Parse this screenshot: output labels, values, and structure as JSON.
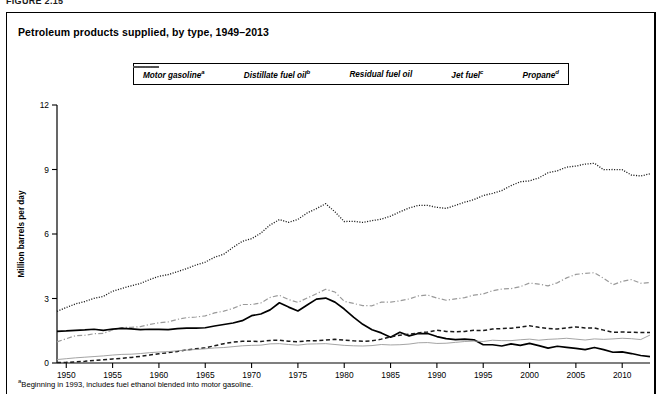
{
  "figure_label": "FIGURE 2.15",
  "chart_title": "Petroleum products supplied, by type, 1949–2013",
  "footnote": "Beginning in 1993, includes fuel ethanol blended into motor gasoline.",
  "footnote_marker": "a",
  "legend": {
    "items": [
      {
        "label": "Motor gasoline",
        "marker": "a",
        "style": "dotted",
        "color": "#1a1a1a",
        "name": "legend-item-motor-gasoline"
      },
      {
        "label": "Distillate fuel oil",
        "marker": "b",
        "style": "dash-dot-light",
        "color": "#9a9a9a",
        "name": "legend-item-distillate-fuel-oil"
      },
      {
        "label": "Residual fuel oil",
        "marker": "",
        "style": "solid",
        "color": "#000000",
        "name": "legend-item-residual-fuel-oil"
      },
      {
        "label": "Jet fuel",
        "marker": "c",
        "style": "dashed",
        "color": "#1a1a1a",
        "name": "legend-item-jet-fuel"
      },
      {
        "label": "Propane",
        "marker": "d",
        "style": "thin-solid-light",
        "color": "#9a9a9a",
        "name": "legend-item-propane"
      }
    ]
  },
  "chart_data": {
    "type": "line",
    "title": "Petroleum products supplied, by type, 1949–2013",
    "xlabel": "",
    "ylabel": "Million barrels per day",
    "xlim": [
      1949,
      2013
    ],
    "ylim": [
      0,
      12
    ],
    "yticks": [
      0,
      3,
      6,
      9,
      12
    ],
    "xticks": [
      1950,
      1955,
      1960,
      1965,
      1970,
      1975,
      1980,
      1985,
      1990,
      1995,
      2000,
      2005,
      2010
    ],
    "grid": false,
    "legend_position": "top-center",
    "x": [
      1949,
      1950,
      1951,
      1952,
      1953,
      1954,
      1955,
      1956,
      1957,
      1958,
      1959,
      1960,
      1961,
      1962,
      1963,
      1964,
      1965,
      1966,
      1967,
      1968,
      1969,
      1970,
      1971,
      1972,
      1973,
      1974,
      1975,
      1976,
      1977,
      1978,
      1979,
      1980,
      1981,
      1982,
      1983,
      1984,
      1985,
      1986,
      1987,
      1988,
      1989,
      1990,
      1991,
      1992,
      1993,
      1994,
      1995,
      1996,
      1997,
      1998,
      1999,
      2000,
      2001,
      2002,
      2003,
      2004,
      2005,
      2006,
      2007,
      2008,
      2009,
      2010,
      2011,
      2012,
      2013
    ],
    "series": [
      {
        "name": "Motor gasoline",
        "marker": "a",
        "style": "dotted",
        "color": "#1a1a1a",
        "values": [
          2.4,
          2.58,
          2.75,
          2.86,
          3.01,
          3.1,
          3.34,
          3.47,
          3.59,
          3.7,
          3.88,
          4.03,
          4.11,
          4.25,
          4.39,
          4.56,
          4.69,
          4.92,
          5.06,
          5.38,
          5.66,
          5.78,
          6.04,
          6.42,
          6.67,
          6.54,
          6.68,
          6.98,
          7.18,
          7.41,
          7.03,
          6.58,
          6.59,
          6.54,
          6.62,
          6.69,
          6.83,
          7.03,
          7.21,
          7.33,
          7.33,
          7.24,
          7.19,
          7.33,
          7.48,
          7.6,
          7.79,
          7.89,
          8.02,
          8.25,
          8.43,
          8.47,
          8.61,
          8.85,
          8.94,
          9.11,
          9.16,
          9.25,
          9.29,
          8.99,
          9.0,
          8.99,
          8.74,
          8.7,
          8.8
        ]
      },
      {
        "name": "Distillate fuel oil",
        "marker": "b",
        "style": "dash-dot-light",
        "color": "#9a9a9a",
        "values": [
          0.98,
          1.13,
          1.27,
          1.29,
          1.36,
          1.38,
          1.54,
          1.65,
          1.66,
          1.69,
          1.79,
          1.87,
          1.91,
          2.03,
          2.11,
          2.14,
          2.19,
          2.33,
          2.41,
          2.54,
          2.72,
          2.72,
          2.79,
          3.05,
          3.15,
          2.95,
          2.82,
          3.02,
          3.22,
          3.43,
          3.3,
          2.87,
          2.77,
          2.67,
          2.66,
          2.83,
          2.83,
          2.89,
          2.98,
          3.12,
          3.16,
          3.02,
          2.92,
          2.98,
          3.04,
          3.16,
          3.21,
          3.36,
          3.44,
          3.46,
          3.55,
          3.72,
          3.67,
          3.59,
          3.73,
          3.96,
          4.12,
          4.17,
          4.2,
          3.94,
          3.64,
          3.8,
          3.88,
          3.71,
          3.74
        ]
      },
      {
        "name": "Residual fuel oil",
        "marker": "",
        "style": "solid",
        "color": "#000000",
        "values": [
          1.47,
          1.49,
          1.52,
          1.54,
          1.57,
          1.52,
          1.58,
          1.61,
          1.59,
          1.55,
          1.57,
          1.56,
          1.55,
          1.6,
          1.62,
          1.62,
          1.64,
          1.72,
          1.79,
          1.86,
          1.97,
          2.2,
          2.28,
          2.47,
          2.8,
          2.6,
          2.42,
          2.7,
          2.97,
          3.02,
          2.83,
          2.51,
          2.13,
          1.8,
          1.55,
          1.4,
          1.2,
          1.43,
          1.26,
          1.37,
          1.37,
          1.23,
          1.13,
          1.09,
          1.11,
          1.08,
          0.85,
          0.85,
          0.79,
          0.89,
          0.82,
          0.91,
          0.81,
          0.69,
          0.78,
          0.73,
          0.68,
          0.62,
          0.72,
          0.62,
          0.5,
          0.52,
          0.44,
          0.35,
          0.3
        ]
      },
      {
        "name": "Jet fuel",
        "marker": "c",
        "style": "dashed",
        "color": "#1a1a1a",
        "values": [
          0.02,
          0.03,
          0.05,
          0.08,
          0.12,
          0.15,
          0.19,
          0.22,
          0.26,
          0.31,
          0.37,
          0.43,
          0.48,
          0.54,
          0.61,
          0.66,
          0.71,
          0.8,
          0.9,
          0.97,
          1.01,
          1.01,
          1.0,
          1.05,
          1.06,
          1.01,
          0.99,
          1.03,
          1.04,
          1.07,
          1.1,
          1.07,
          1.03,
          1.01,
          1.03,
          1.11,
          1.22,
          1.29,
          1.34,
          1.4,
          1.44,
          1.52,
          1.47,
          1.45,
          1.47,
          1.52,
          1.51,
          1.58,
          1.6,
          1.62,
          1.67,
          1.73,
          1.66,
          1.61,
          1.58,
          1.63,
          1.68,
          1.63,
          1.63,
          1.53,
          1.43,
          1.44,
          1.43,
          1.42,
          1.42
        ]
      },
      {
        "name": "Propane",
        "marker": "d",
        "style": "thin-solid-light",
        "color": "#9a9a9a",
        "values": [
          0.16,
          0.2,
          0.24,
          0.27,
          0.3,
          0.33,
          0.37,
          0.4,
          0.41,
          0.44,
          0.48,
          0.51,
          0.53,
          0.57,
          0.6,
          0.63,
          0.66,
          0.7,
          0.72,
          0.76,
          0.8,
          0.82,
          0.83,
          0.89,
          0.9,
          0.86,
          0.83,
          0.88,
          0.89,
          0.9,
          0.86,
          0.82,
          0.8,
          0.79,
          0.81,
          0.86,
          0.84,
          0.85,
          0.88,
          0.94,
          0.95,
          0.91,
          0.92,
          0.96,
          1.0,
          1.02,
          1.0,
          1.06,
          1.04,
          1.04,
          1.08,
          1.11,
          1.06,
          1.1,
          1.12,
          1.15,
          1.11,
          1.07,
          1.12,
          1.1,
          1.12,
          1.15,
          1.13,
          1.09,
          1.3
        ]
      }
    ]
  },
  "plot_geometry": {
    "left": 57,
    "right": 650,
    "top": 105,
    "bottom": 363
  }
}
